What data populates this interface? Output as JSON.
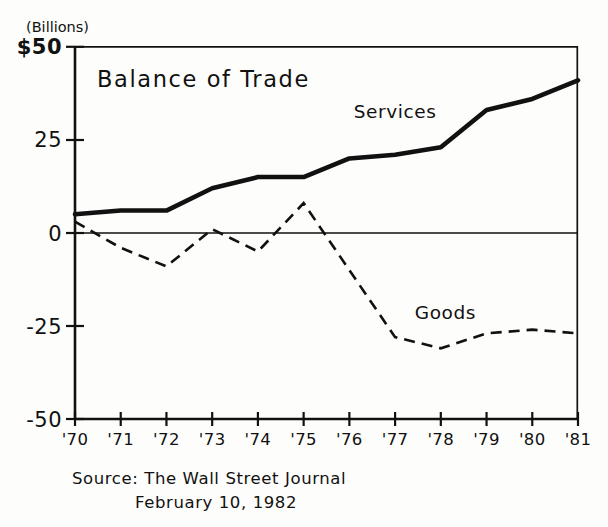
{
  "chart_data": {
    "type": "line",
    "title": "Balance of Trade",
    "unit_label": "(Billions)",
    "xlabel": "",
    "ylabel": "",
    "grid": false,
    "legend": "inline-annotations",
    "ylim": [
      -50,
      50
    ],
    "yticks": [
      50,
      25,
      0,
      -25,
      -50
    ],
    "ytick_labels": [
      "$50",
      "25",
      "0",
      "-25",
      "-50"
    ],
    "categories": [
      "'70",
      "'71",
      "'72",
      "'73",
      "'74",
      "'75",
      "'76",
      "'77",
      "'78",
      "'79",
      "'80",
      "'81"
    ],
    "x": [
      1970,
      1971,
      1972,
      1973,
      1974,
      1975,
      1976,
      1977,
      1978,
      1979,
      1980,
      1981
    ],
    "series": [
      {
        "name": "Services",
        "style": "solid",
        "values": [
          5,
          6,
          6,
          12,
          15,
          15,
          20,
          21,
          23,
          33,
          36,
          41
        ]
      },
      {
        "name": "Goods",
        "style": "dashed",
        "values": [
          3,
          -4,
          -9,
          1,
          -5,
          8,
          -10,
          -28,
          -31,
          -27,
          -26,
          -27
        ]
      }
    ],
    "annotations": [
      {
        "text": "Services",
        "x": 1977.0,
        "y": 31
      },
      {
        "text": "Goods",
        "x": 1978.1,
        "y": -23
      }
    ],
    "source_lines": [
      "Source: The Wall Street Journal",
      "February 10, 1982"
    ]
  },
  "colors": {
    "ink": "#111111",
    "paper": "#fdfdfb"
  }
}
